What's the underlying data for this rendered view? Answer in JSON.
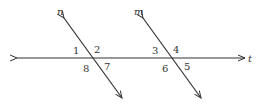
{
  "diagram": {
    "stroke_color": "#333333",
    "lines": {
      "t": {
        "label": "t"
      },
      "n": {
        "label": "n"
      },
      "m": {
        "label": "m"
      }
    },
    "angles": {
      "a1": "1",
      "a2": "2",
      "a7": "7",
      "a8": "8",
      "a3": "3",
      "a4": "4",
      "a5": "5",
      "a6": "6"
    }
  }
}
